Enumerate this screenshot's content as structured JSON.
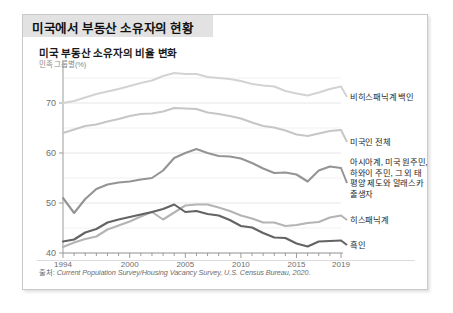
{
  "header": {
    "title": "미국에서 부동산 소유자의 현황"
  },
  "chart_header": {
    "title": "미국 부동산 소유자의 비율 변화",
    "subtitle": "민족 그룹별(%)"
  },
  "source": {
    "prefix": "출처: ",
    "text": "Current Population Survey/Housing Vacancy Survey, U.S. Census Bureau, 2020."
  },
  "axis": {
    "y_ticks": [
      "70",
      "60",
      "50",
      "40"
    ],
    "y_values": [
      70,
      60,
      50,
      40
    ],
    "x_ticks": [
      "1994",
      "2000",
      "2005",
      "2010",
      "2015",
      "2019"
    ],
    "x_values": [
      1994,
      2000,
      2005,
      2010,
      2015,
      2019
    ]
  },
  "legend": [
    {
      "key": "white",
      "label": "비히스패닉계 백인",
      "color": "#d3d3d3"
    },
    {
      "key": "all",
      "label": "미국인 전체",
      "color": "#c6c6c6"
    },
    {
      "key": "asian",
      "label": "아시아계, 미국 원주민, 하와이 주민, 그 외 태평양 제도와 알래스카 출생자",
      "color": "#949494"
    },
    {
      "key": "hispanic",
      "label": "히스패닉계",
      "color": "#b4b4b4"
    },
    {
      "key": "black",
      "label": "흑인",
      "color": "#636363"
    }
  ],
  "chart_data": {
    "type": "line",
    "title": "미국 부동산 소유자의 비율 변화",
    "subtitle": "민족 그룹별(%)",
    "xlabel": "",
    "ylabel": "민족 그룹별(%)",
    "xlim": [
      1994,
      2019
    ],
    "ylim": [
      40,
      76
    ],
    "grid": "horizontal",
    "legend_position": "right-inline",
    "x": [
      1994,
      1995,
      1996,
      1997,
      1998,
      1999,
      2000,
      2001,
      2002,
      2003,
      2004,
      2005,
      2006,
      2007,
      2008,
      2009,
      2010,
      2011,
      2012,
      2013,
      2014,
      2015,
      2016,
      2017,
      2018,
      2019
    ],
    "series": [
      {
        "name": "비히스패닉계 백인",
        "key": "white",
        "color": "#d3d3d3",
        "values": [
          70.0,
          70.4,
          71.1,
          71.8,
          72.3,
          72.8,
          73.4,
          74.0,
          74.5,
          75.4,
          76.0,
          75.8,
          75.8,
          75.2,
          75.0,
          74.8,
          74.4,
          73.8,
          73.5,
          73.3,
          72.4,
          71.9,
          71.5,
          72.1,
          72.8,
          73.3
        ]
      },
      {
        "name": "미국인 전체",
        "key": "all",
        "color": "#c6c6c6",
        "values": [
          64.0,
          64.7,
          65.4,
          65.7,
          66.3,
          66.8,
          67.4,
          67.8,
          67.9,
          68.3,
          69.0,
          68.9,
          68.8,
          68.1,
          67.8,
          67.4,
          66.9,
          66.1,
          65.4,
          65.1,
          64.5,
          63.7,
          63.4,
          63.9,
          64.4,
          64.6
        ]
      },
      {
        "name": "아시아계, 미국 원주민, 하와이 주민, 그 외 태평양 제도와 알래스카 출생자",
        "key": "asian",
        "color": "#949494",
        "values": [
          51.0,
          48.0,
          50.8,
          52.8,
          53.7,
          54.1,
          54.3,
          54.7,
          55.0,
          56.5,
          59.0,
          60.0,
          60.8,
          60.0,
          59.4,
          59.3,
          58.9,
          58.0,
          56.9,
          56.0,
          56.1,
          55.7,
          54.3,
          56.5,
          57.3,
          57.0
        ]
      },
      {
        "name": "히스패닉계",
        "key": "hispanic",
        "color": "#b4b4b4",
        "values": [
          41.2,
          42.1,
          42.8,
          43.3,
          44.7,
          45.5,
          46.3,
          47.3,
          48.2,
          46.7,
          48.1,
          49.5,
          49.7,
          49.7,
          49.1,
          48.4,
          47.5,
          46.9,
          46.1,
          46.1,
          45.4,
          45.6,
          46.0,
          46.2,
          47.1,
          47.5
        ]
      },
      {
        "name": "흑인",
        "key": "black",
        "color": "#636363",
        "values": [
          42.3,
          42.7,
          44.1,
          44.8,
          46.1,
          46.7,
          47.2,
          47.7,
          48.2,
          48.8,
          49.7,
          48.2,
          48.4,
          47.8,
          47.5,
          46.6,
          45.4,
          45.1,
          44.0,
          43.1,
          43.0,
          41.9,
          41.3,
          42.3,
          42.4,
          42.5
        ]
      }
    ]
  }
}
